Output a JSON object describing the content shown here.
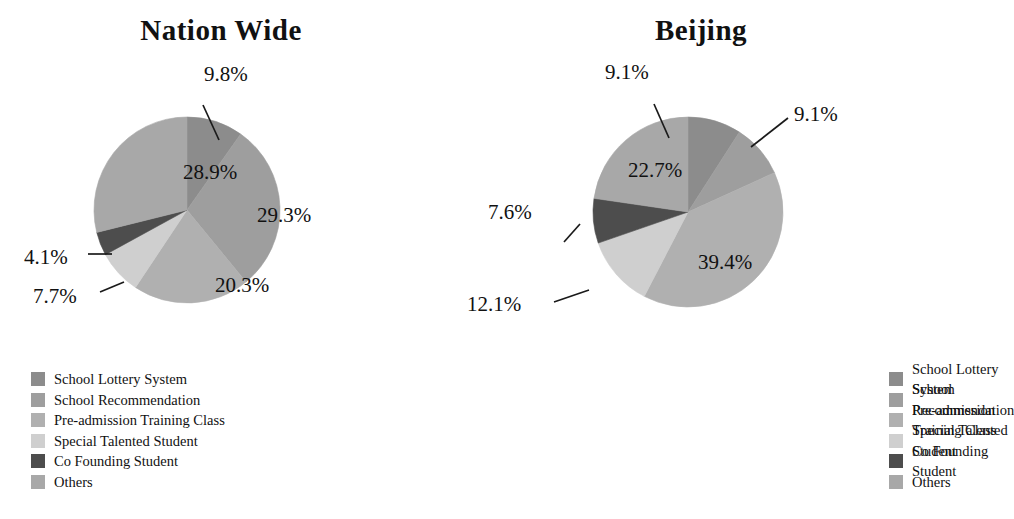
{
  "figure": {
    "background": "#ffffff",
    "text_color": "#111111"
  },
  "palette": {
    "school_lottery_system": "#8c8c8c",
    "school_recommendation": "#9e9e9e",
    "pre_admission_training_class": "#b0b0b0",
    "special_talented_student": "#cfcfcf",
    "co_founding_student": "#4d4d4d",
    "others": "#a8a8a8"
  },
  "legend_items": [
    {
      "label": "School Lottery System",
      "color": "#8c8c8c"
    },
    {
      "label": "School Recommendation",
      "color": "#9e9e9e"
    },
    {
      "label": "Pre-admission Training Class",
      "color": "#b0b0b0"
    },
    {
      "label": "Special Talented Student",
      "color": "#cfcfcf"
    },
    {
      "label": "Co Founding Student",
      "color": "#4d4d4d"
    },
    {
      "label": "Others",
      "color": "#a8a8a8"
    }
  ],
  "chart_data": [
    {
      "type": "pie",
      "title": "Nation Wide",
      "categories": [
        "School Lottery System",
        "School Recommendation",
        "Pre-admission Training Class",
        "Special Talented Student",
        "Co Founding Student",
        "Others"
      ],
      "values": [
        9.8,
        29.3,
        20.3,
        7.7,
        4.1,
        28.9
      ],
      "labels": [
        "9.8%",
        "29.3%",
        "20.3%",
        "7.7%",
        "4.1%",
        "28.9%"
      ],
      "colors": [
        "#8c8c8c",
        "#9e9e9e",
        "#b0b0b0",
        "#cfcfcf",
        "#4d4d4d",
        "#a8a8a8"
      ],
      "unit": "%",
      "start_angle_deg": 0,
      "direction": "clockwise",
      "legend_position": "bottom-left"
    },
    {
      "type": "pie",
      "title": "Beijing",
      "categories": [
        "School Lottery System",
        "School Recommendation",
        "Pre-admission Training Class",
        "Special Talented Student",
        "Co Founding Student",
        "Others"
      ],
      "values": [
        9.1,
        9.1,
        39.4,
        12.1,
        7.6,
        22.7
      ],
      "labels": [
        "9.1%",
        "9.1%",
        "39.4%",
        "12.1%",
        "7.6%",
        "22.7%"
      ],
      "colors": [
        "#8c8c8c",
        "#9e9e9e",
        "#b0b0b0",
        "#cfcfcf",
        "#4d4d4d",
        "#a8a8a8"
      ],
      "unit": "%",
      "start_angle_deg": 0,
      "direction": "clockwise",
      "legend_position": "bottom-left"
    }
  ],
  "left_chart": {
    "title": "Nation Wide",
    "inside_labels": {
      "school_recommendation": "29.3%",
      "pre_admission_training_class": "20.3%",
      "others": "28.9%"
    },
    "callouts": {
      "school_lottery_system": "9.8%",
      "co_founding_student": "4.1%",
      "special_talented_student": "7.7%"
    }
  },
  "right_chart": {
    "title": "Beijing",
    "inside_labels": {
      "others": "22.7%",
      "pre_admission_training_class": "39.4%"
    },
    "callouts": {
      "school_lottery_system": "9.1%",
      "school_recommendation": "9.1%",
      "co_founding_student": "7.6%",
      "special_talented_student": "12.1%"
    }
  }
}
